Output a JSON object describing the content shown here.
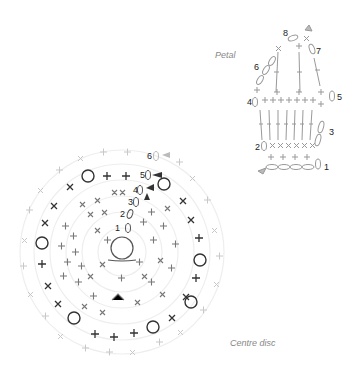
{
  "petal": {
    "title": "Petal",
    "row_numbers": [
      "1",
      "2",
      "3",
      "4",
      "5",
      "6",
      "7",
      "8"
    ]
  },
  "centre_disc": {
    "title": "Centre disc",
    "row_numbers": [
      "1",
      "2",
      "3",
      "4",
      "5",
      "6"
    ]
  },
  "colors": {
    "dark_stitch": "#333333",
    "mid_stitch": "#777777",
    "light_stitch": "#bbbbbb",
    "guide_ring": "#eeeeee",
    "label": "#222222",
    "caption": "#888888"
  }
}
